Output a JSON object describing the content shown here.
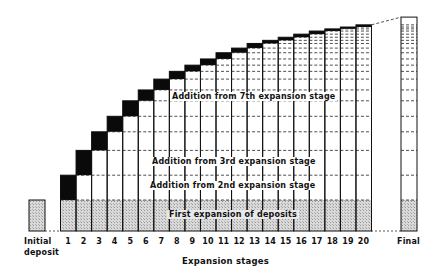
{
  "diagram": {
    "title": "Expansion of deposits",
    "axis_label": "Expansion stages",
    "initial_label_line1": "Initial",
    "initial_label_line2": "deposit",
    "final_label": "Final",
    "stage_labels": [
      "1",
      "2",
      "3",
      "4",
      "5",
      "6",
      "7",
      "8",
      "9",
      "10",
      "11",
      "12",
      "13",
      "14",
      "15",
      "16",
      "17",
      "18",
      "19",
      "20"
    ],
    "band_labels": {
      "first": "First expansion of deposits",
      "second": "Addition from 2nd expansion stage",
      "third": "Addition from 3rd expansion stage",
      "seventh": "Addition from 7th expansion stage"
    },
    "colors": {
      "ink": "#111111",
      "hatch": "#cfcfcf",
      "block": "#0a0a0a"
    }
  },
  "chart_data": {
    "type": "bar",
    "title": "",
    "xlabel": "Expansion stages",
    "ylabel": "",
    "categories": [
      "Initial deposit",
      "1",
      "2",
      "3",
      "4",
      "5",
      "6",
      "7",
      "8",
      "9",
      "10",
      "11",
      "12",
      "13",
      "14",
      "15",
      "16",
      "17",
      "18",
      "19",
      "20",
      "Final"
    ],
    "series": [
      {
        "name": "Cumulative deposits (relative height)",
        "values": [
          1.0,
          1.8,
          2.6,
          3.2,
          3.7,
          4.2,
          4.55,
          4.9,
          5.15,
          5.35,
          5.55,
          5.75,
          5.9,
          6.05,
          6.15,
          6.25,
          6.35,
          6.45,
          6.52,
          6.58,
          6.65,
          6.9
        ]
      }
    ],
    "annotations": [
      "First expansion of deposits",
      "Addition from 2nd expansion stage",
      "Addition from 3rd expansion stage",
      "Addition from 7th expansion stage"
    ],
    "grid": false,
    "legend": "none"
  }
}
